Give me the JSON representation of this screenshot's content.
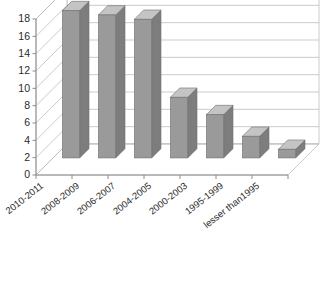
{
  "chart_data": {
    "type": "bar",
    "title": "",
    "xlabel": "",
    "ylabel": "",
    "categories": [
      "2010-2011",
      "2008-2009",
      "2006-2007",
      "2004-2005",
      "2000-2003",
      "1995-1999",
      "lesser than1995"
    ],
    "values": [
      17,
      16.5,
      16,
      7,
      5,
      2.5,
      1
    ],
    "ylim": [
      0,
      18
    ],
    "ytick_step": 2,
    "yticks": [
      "18",
      "16",
      "14",
      "12",
      "10",
      "8",
      "6",
      "4",
      "2",
      "0"
    ],
    "grid": true,
    "grid_orientation": "horizontal",
    "legend": "none",
    "style": "3d-column",
    "colors": {
      "bar_front": "#9a9a9a",
      "bar_side": "#7d7d7d",
      "bar_top": "#c4c4c4",
      "bar_outline": "#6f6f6f",
      "gridline": "#b4b4b4",
      "axis": "#8c8c8c",
      "wall": "#ffffff",
      "floor": "#ffffff",
      "text": "#2b2b2b",
      "background": "#ffffff"
    }
  }
}
